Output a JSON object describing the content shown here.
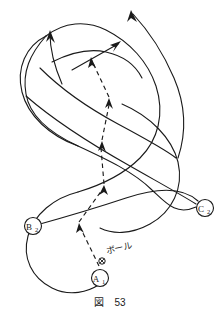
{
  "figure": {
    "caption_label": "図",
    "caption_number": "53",
    "background_color": "#ffffff",
    "stroke_color": "#1a1a1a",
    "width": 220,
    "height": 317
  },
  "annotations": {
    "ball_label": "ボール"
  },
  "nodes": [
    {
      "id": "A1",
      "letter": "A",
      "subscript": "1",
      "cx": 100,
      "cy": 278,
      "r": 8.5
    },
    {
      "id": "B2",
      "letter": "B",
      "subscript": "2",
      "cx": 33,
      "cy": 226,
      "r": 8.5
    },
    {
      "id": "C2",
      "letter": "C",
      "subscript": "2",
      "cx": 205,
      "cy": 208,
      "r": 8.5
    }
  ],
  "ball_marker": {
    "cx": 102,
    "cy": 261,
    "r": 3.2,
    "glyph": "cross-circle"
  },
  "chart_data": {
    "type": "diagram",
    "helix_strands": [
      {
        "name": "strand-front",
        "path": "M 20 232 C 8 188 34 150 72 134 C 110 118 150 104 160 70 C 168 42 150 22 133 12"
      },
      {
        "name": "strand-back",
        "path": "M 25 226 C 46 270 92 288 124 276 C 160 262 178 230 176 196 C 174 160 140 140 108 130 C 74 120 52 96 58 68 C 62 46 78 34 92 30"
      },
      {
        "name": "strand-mid",
        "path": "M 33 226 C 62 216 96 204 128 194 C 158 184 186 184 203 202"
      },
      {
        "name": "strand-upper-cross",
        "path": "M 44 86 C 70 118 110 140 142 160 C 168 176 184 194 196 206"
      },
      {
        "name": "strand-top-cross",
        "path": "M 55 44 C 74 68 100 86 124 98 C 150 112 168 124 178 136"
      }
    ],
    "arrows_solid": [
      {
        "name": "arrow-top-left",
        "tip_x": 50,
        "tip_y": 31,
        "angle_deg": -78
      },
      {
        "name": "arrow-top-mid",
        "tip_x": 119,
        "tip_y": 42,
        "angle_deg": -38
      },
      {
        "name": "arrow-top-right",
        "tip_x": 131,
        "tip_y": 11,
        "angle_deg": -62
      }
    ],
    "dashed_pass_path": {
      "name": "ball-pass-zigzag",
      "points": [
        {
          "x": 99,
          "y": 264
        },
        {
          "x": 79,
          "y": 225
        },
        {
          "x": 105,
          "y": 186
        },
        {
          "x": 102,
          "y": 143
        },
        {
          "x": 110,
          "y": 100
        },
        {
          "x": 90,
          "y": 55
        }
      ],
      "arrow_tips": [
        {
          "x": 79,
          "y": 225,
          "angle_deg": -118
        },
        {
          "x": 104,
          "y": 187,
          "angle_deg": -56
        },
        {
          "x": 102,
          "y": 144,
          "angle_deg": -86
        },
        {
          "x": 109,
          "y": 101,
          "angle_deg": -80
        },
        {
          "x": 90,
          "y": 56,
          "angle_deg": -114
        }
      ]
    }
  }
}
